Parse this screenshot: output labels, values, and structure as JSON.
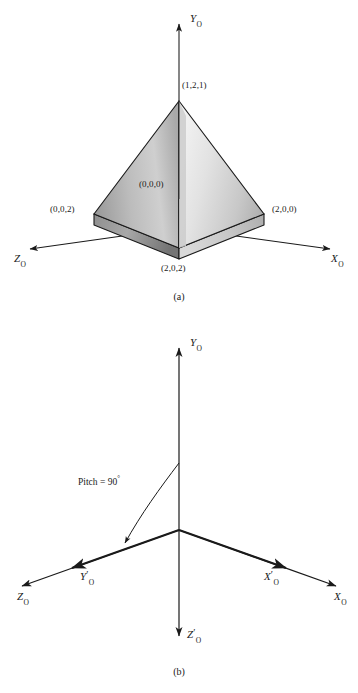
{
  "figure": {
    "panels": [
      {
        "id": "a",
        "caption": "(a)",
        "axes": [
          {
            "name": "y-axis",
            "base": "Y",
            "sub": "O",
            "prime": "",
            "label": "Y_O"
          },
          {
            "name": "z-axis",
            "base": "Z",
            "sub": "O",
            "prime": "",
            "label": "Z_O"
          },
          {
            "name": "x-axis",
            "base": "X",
            "sub": "O",
            "prime": "",
            "label": "X_O"
          }
        ],
        "vertices": [
          {
            "name": "apex",
            "label": "(1,2,1)"
          },
          {
            "name": "origin",
            "label": "(0,0,0)"
          },
          {
            "name": "left-base",
            "label": "(0,0,2)"
          },
          {
            "name": "right-base",
            "label": "(2,0,0)"
          },
          {
            "name": "front-base",
            "label": "(2,0,2)"
          }
        ]
      },
      {
        "id": "b",
        "caption": "(b)",
        "annotation": {
          "text": "Pitch = 90",
          "degree": "°"
        },
        "axes": [
          {
            "name": "y-axis",
            "base": "Y",
            "sub": "O",
            "prime": "",
            "label": "Y_O"
          },
          {
            "name": "z-axis",
            "base": "Z",
            "sub": "O",
            "prime": "",
            "label": "Z_O"
          },
          {
            "name": "x-axis",
            "base": "X",
            "sub": "O",
            "prime": "",
            "label": "X_O"
          },
          {
            "name": "y-prime-axis",
            "base": "Y",
            "sub": "O",
            "prime": "′",
            "label": "Y'_O"
          },
          {
            "name": "x-prime-axis",
            "base": "X",
            "sub": "O",
            "prime": "′",
            "label": "X'_O"
          },
          {
            "name": "z-prime-axis",
            "base": "Z",
            "sub": "O",
            "prime": "′",
            "label": "Z'_O"
          }
        ]
      }
    ],
    "colors": {
      "line": "#1a1a1a",
      "face_light": "#e8e8e8",
      "face_mid": "#b4b4b4",
      "face_dark": "#8a8a8a",
      "axis": "#1a1a1a",
      "hidden_edge": "#4a4a4a"
    }
  }
}
